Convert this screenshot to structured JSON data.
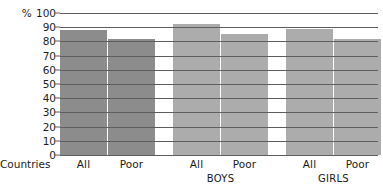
{
  "chart_data": {
    "type": "bar",
    "title": "",
    "xlabel": "",
    "ylabel": "%",
    "ylim": [
      0,
      100
    ],
    "yticks": [
      0,
      10,
      20,
      30,
      40,
      50,
      60,
      70,
      80,
      90,
      100
    ],
    "ytick_labels": [
      "0",
      "10",
      "20",
      "30",
      "40",
      "50",
      "60",
      "70",
      "80",
      "90",
      "100"
    ],
    "y_unit_prefix": "%",
    "grid": true,
    "legend": "none",
    "categories": [
      "All",
      "Poor",
      "All",
      "Poor",
      "All",
      "Poor"
    ],
    "values": [
      88,
      82,
      92,
      85,
      89,
      82
    ],
    "groups": [
      {
        "name": "Countries",
        "color": "#8c8c8c",
        "bars": [
          {
            "label": "All",
            "value": 88
          },
          {
            "label": "Poor",
            "value": 82
          }
        ]
      },
      {
        "name": "BOYS",
        "color": "#acacac",
        "bars": [
          {
            "label": "All",
            "value": 92
          },
          {
            "label": "Poor",
            "value": 85
          }
        ]
      },
      {
        "name": "GIRLS",
        "color": "#acacac",
        "bars": [
          {
            "label": "All",
            "value": 89
          },
          {
            "label": "Poor",
            "value": 82
          }
        ]
      }
    ],
    "axis_row_label": "Countries",
    "colors": {
      "bar_dark": "#8c8c8c",
      "bar_light": "#acacac",
      "gridline": "#5e5e5e",
      "text": "#1a1a1a",
      "background": "#ffffff"
    }
  }
}
